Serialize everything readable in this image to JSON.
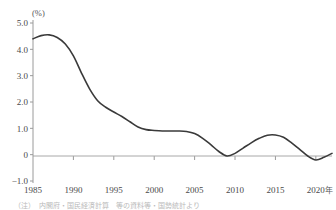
{
  "chart_data": {
    "type": "line",
    "title": "",
    "subtitle": "",
    "xlabel": "",
    "ylabel": "",
    "y_unit_label": "(%)",
    "x_unit_label": "年",
    "xlim": [
      1985,
      2022
    ],
    "ylim": [
      -1.0,
      5.0
    ],
    "grid": false,
    "legend": null,
    "zero_line": true,
    "y_ticks": [
      5.0,
      4.0,
      3.0,
      2.0,
      1.0,
      0,
      -1.0
    ],
    "y_tick_labels": [
      "5.0",
      "4.0",
      "3.0",
      "2.0",
      "1.0",
      "0",
      "−1.0"
    ],
    "x_ticks": [
      1985,
      1990,
      1995,
      2000,
      2005,
      2010,
      2015,
      2020
    ],
    "x_tick_labels": [
      "1985",
      "1990",
      "1995",
      "2000",
      "2005",
      "2010",
      "2015",
      "2020"
    ],
    "series": [
      {
        "name": "rate",
        "color": "#3a3a3a",
        "x": [
          1985,
          1986,
          1987,
          1988,
          1989,
          1990,
          1991,
          1992,
          1993,
          1994,
          1995,
          1996,
          1997,
          1998,
          1999,
          2000,
          2001,
          2002,
          2003,
          2004,
          2005,
          2006,
          2007,
          2008,
          2009,
          2010,
          2011,
          2012,
          2013,
          2014,
          2015,
          2016,
          2017,
          2018,
          2019,
          2020,
          2021,
          2022
        ],
        "values": [
          4.4,
          4.52,
          4.55,
          4.45,
          4.2,
          3.75,
          3.1,
          2.5,
          2.05,
          1.8,
          1.62,
          1.45,
          1.25,
          1.05,
          0.95,
          0.92,
          0.9,
          0.9,
          0.9,
          0.88,
          0.8,
          0.62,
          0.38,
          0.12,
          -0.05,
          0.05,
          0.25,
          0.45,
          0.62,
          0.74,
          0.75,
          0.66,
          0.45,
          0.2,
          -0.05,
          -0.2,
          -0.1,
          0.05
        ]
      }
    ],
    "annotations": []
  },
  "footer": {
    "caption": "（注）　内閣府・国民経済計算　等の資料等・国勢統計より"
  }
}
